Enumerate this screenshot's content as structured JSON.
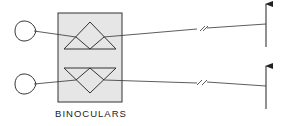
{
  "diagram": {
    "label": "BINOCULARS",
    "elements": [
      {
        "type": "eye",
        "position": "upper"
      },
      {
        "type": "eye",
        "position": "lower"
      },
      {
        "type": "prism-box",
        "label": "BINOCULARS"
      },
      {
        "type": "prism",
        "orientation": "upward",
        "position": "upper"
      },
      {
        "type": "prism",
        "orientation": "downward",
        "position": "lower"
      },
      {
        "type": "object-arrow",
        "position": "upper"
      },
      {
        "type": "object-arrow",
        "position": "lower"
      }
    ],
    "colors": {
      "line": "#333333",
      "box_fill": "#e6e6e6",
      "background": "#ffffff"
    }
  }
}
